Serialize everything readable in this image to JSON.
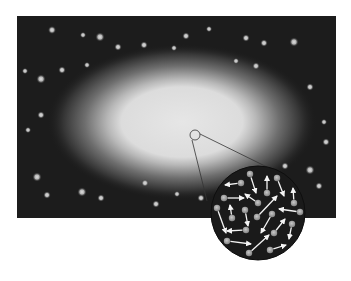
{
  "diagram": {
    "colors": {
      "background": "#ffffff",
      "sky": "#1c1c1c",
      "glow_core": "#e2e2e2",
      "glow_mid": "#9a9a9a",
      "star": "#bdbdbd",
      "inset_bg": "#1a1a1a",
      "particle": "#a8a8a8",
      "arrow": "#f4f4f4",
      "callout_line": "#333333"
    },
    "panel": {
      "x": 17,
      "y": 16,
      "width": 319,
      "height": 202
    },
    "glow": {
      "cx": 182,
      "cy": 122,
      "core_rx": 72,
      "core_ry": 38,
      "halo_rx": 135,
      "halo_ry": 78
    },
    "magnifier": {
      "source": {
        "cx": 195,
        "cy": 135,
        "r": 5
      },
      "inset": {
        "cx": 258,
        "cy": 213,
        "r": 47
      },
      "lines": [
        {
          "x1": 192,
          "y1": 140,
          "x2": 207,
          "y2": 201
        },
        {
          "x1": 200,
          "y1": 134,
          "x2": 267,
          "y2": 167
        }
      ]
    },
    "stars": [
      {
        "x": 52,
        "y": 30,
        "r": 2.6
      },
      {
        "x": 83,
        "y": 35,
        "r": 2
      },
      {
        "x": 100,
        "y": 37,
        "r": 3
      },
      {
        "x": 118,
        "y": 47,
        "r": 2.4
      },
      {
        "x": 144,
        "y": 45,
        "r": 2.4
      },
      {
        "x": 25,
        "y": 71,
        "r": 2
      },
      {
        "x": 62,
        "y": 70,
        "r": 2.4
      },
      {
        "x": 87,
        "y": 65,
        "r": 2
      },
      {
        "x": 41,
        "y": 79,
        "r": 3
      },
      {
        "x": 174,
        "y": 48,
        "r": 2
      },
      {
        "x": 186,
        "y": 36,
        "r": 2.4
      },
      {
        "x": 209,
        "y": 29,
        "r": 2
      },
      {
        "x": 246,
        "y": 38,
        "r": 2.4
      },
      {
        "x": 264,
        "y": 43,
        "r": 2.4
      },
      {
        "x": 294,
        "y": 42,
        "r": 3
      },
      {
        "x": 236,
        "y": 61,
        "r": 2
      },
      {
        "x": 256,
        "y": 66,
        "r": 2.4
      },
      {
        "x": 310,
        "y": 87,
        "r": 2.4
      },
      {
        "x": 41,
        "y": 115,
        "r": 2.4
      },
      {
        "x": 28,
        "y": 130,
        "r": 2
      },
      {
        "x": 324,
        "y": 122,
        "r": 2
      },
      {
        "x": 326,
        "y": 142,
        "r": 2.4
      },
      {
        "x": 37,
        "y": 177,
        "r": 3
      },
      {
        "x": 47,
        "y": 195,
        "r": 2.4
      },
      {
        "x": 82,
        "y": 192,
        "r": 3
      },
      {
        "x": 101,
        "y": 198,
        "r": 2.4
      },
      {
        "x": 145,
        "y": 183,
        "r": 2.4
      },
      {
        "x": 156,
        "y": 204,
        "r": 2.4
      },
      {
        "x": 177,
        "y": 194,
        "r": 2
      },
      {
        "x": 201,
        "y": 198,
        "r": 2.4
      },
      {
        "x": 285,
        "y": 166,
        "r": 2.4
      },
      {
        "x": 310,
        "y": 170,
        "r": 3
      },
      {
        "x": 319,
        "y": 186,
        "r": 2.4
      }
    ],
    "particles": [
      {
        "x": 241,
        "y": 183,
        "tx": 225,
        "ty": 185
      },
      {
        "x": 250,
        "y": 174,
        "tx": 256,
        "ty": 193
      },
      {
        "x": 267,
        "y": 193,
        "tx": 267,
        "ty": 176
      },
      {
        "x": 277,
        "y": 178,
        "tx": 284,
        "ty": 196
      },
      {
        "x": 294,
        "y": 203,
        "tx": 293,
        "ty": 188
      },
      {
        "x": 224,
        "y": 198,
        "tx": 244,
        "ty": 198
      },
      {
        "x": 258,
        "y": 203,
        "tx": 245,
        "ty": 194
      },
      {
        "x": 217,
        "y": 208,
        "tx": 226,
        "ty": 233
      },
      {
        "x": 232,
        "y": 218,
        "tx": 230,
        "ty": 205
      },
      {
        "x": 245,
        "y": 210,
        "tx": 248,
        "ty": 226
      },
      {
        "x": 257,
        "y": 217,
        "tx": 277,
        "ty": 196
      },
      {
        "x": 272,
        "y": 214,
        "tx": 261,
        "ty": 233
      },
      {
        "x": 300,
        "y": 212,
        "tx": 279,
        "ty": 209
      },
      {
        "x": 246,
        "y": 230,
        "tx": 227,
        "ty": 231
      },
      {
        "x": 292,
        "y": 224,
        "tx": 289,
        "ty": 239
      },
      {
        "x": 274,
        "y": 233,
        "tx": 285,
        "ty": 219
      },
      {
        "x": 227,
        "y": 241,
        "tx": 251,
        "ty": 244
      },
      {
        "x": 249,
        "y": 253,
        "tx": 269,
        "ty": 235
      },
      {
        "x": 270,
        "y": 250,
        "tx": 286,
        "ty": 245
      }
    ]
  }
}
